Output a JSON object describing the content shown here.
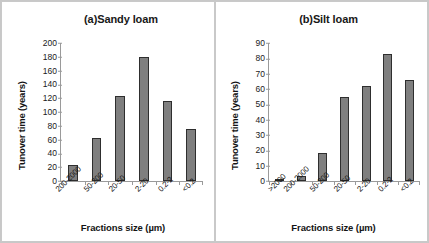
{
  "figure": {
    "panels": [
      "a",
      "b"
    ]
  },
  "chart_data": [
    {
      "type": "bar",
      "title": "(a)Sandy loam",
      "xlabel": "Fractions size (µm)",
      "ylabel": "Tunover time (years)",
      "categories": [
        "200-2000",
        "50-200",
        "20-50",
        "2-20",
        "0.2-2",
        "<0.2"
      ],
      "values": [
        23,
        62,
        123,
        180,
        116,
        76
      ],
      "ylim": [
        0,
        200
      ],
      "yticks": [
        0,
        20,
        40,
        60,
        80,
        100,
        120,
        140,
        160,
        180,
        200
      ],
      "grid": false,
      "legend": "none",
      "bar_color": "#7f7f7f",
      "bar_border_color": "#2e2e2e"
    },
    {
      "type": "bar",
      "title": "(b)Silt loam",
      "xlabel": "Fractions size (µm)",
      "ylabel": "Tunover time (years)",
      "categories": [
        ">2000",
        "200-2000",
        "50-200",
        "20-50",
        "2-20",
        "0.2-2",
        "<0.2"
      ],
      "values": [
        0.5,
        3,
        18.5,
        55,
        62,
        83,
        66
      ],
      "ylim": [
        0,
        90
      ],
      "yticks": [
        0,
        10,
        20,
        30,
        40,
        50,
        60,
        70,
        80,
        90
      ],
      "grid": false,
      "legend": "none",
      "bar_color": "#7f7f7f",
      "bar_border_color": "#2e2e2e"
    }
  ]
}
